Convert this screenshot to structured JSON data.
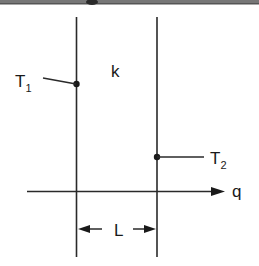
{
  "diagram": {
    "labels": {
      "t1_main": "T",
      "t1_sub": "1",
      "t2_main": "T",
      "t2_sub": "2",
      "conductivity": "k",
      "heat_flow": "q",
      "thickness": "L"
    },
    "colors": {
      "line": "#2a2a2a",
      "text": "#1a1a1a",
      "top_band": "#6e6e6e",
      "background": "#ffffff"
    }
  }
}
